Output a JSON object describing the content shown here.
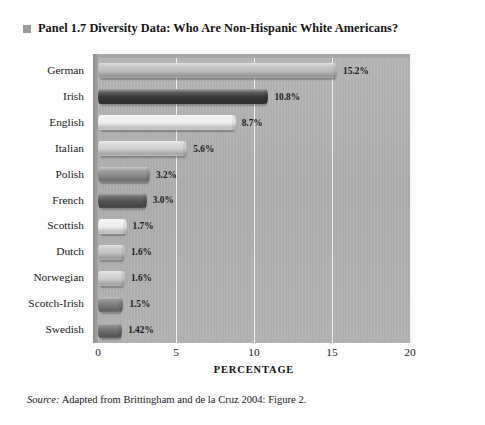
{
  "title": {
    "bullet": "square-bullet",
    "text": "Panel 1.7  Diversity Data: Who Are Non-Hispanic White Americans?"
  },
  "source": {
    "label": "Source:",
    "text": " Adapted from Brittingham and de la Cruz 2004: Figure 2."
  },
  "chart_data": {
    "type": "bar",
    "orientation": "horizontal",
    "title": "Diversity Data: Who Are Non-Hispanic White Americans?",
    "xlabel": "PERCENTAGE",
    "ylabel": "",
    "xlim": [
      0,
      20
    ],
    "xticks": [
      "0",
      "5",
      "10",
      "15",
      "20"
    ],
    "xtick_values": [
      0,
      5,
      10,
      15,
      20
    ],
    "grid": true,
    "legend": "none",
    "plot_background": "#b2b2b2",
    "categories": [
      "German",
      "Irish",
      "English",
      "Italian",
      "Polish",
      "French",
      "Scottish",
      "Dutch",
      "Norwegian",
      "Scotch-Irish",
      "Swedish"
    ],
    "values": [
      15.2,
      10.8,
      8.7,
      5.6,
      3.2,
      3.0,
      1.7,
      1.6,
      1.6,
      1.5,
      1.42
    ],
    "data_labels": [
      "15.2%",
      "10.8%",
      "8.7%",
      "5.6%",
      "3.2%",
      "3.0%",
      "1.7%",
      "1.6%",
      "1.6%",
      "1.5%",
      "1.42%"
    ],
    "bar_colors": [
      "#bdbdbd",
      "#3a3a3a",
      "#eeeeee",
      "#d2d2d2",
      "#8e8e8e",
      "#565656",
      "#ededed",
      "#c4c4c4",
      "#cfcfcf",
      "#7d7d7d",
      "#6e6e6e"
    ]
  }
}
